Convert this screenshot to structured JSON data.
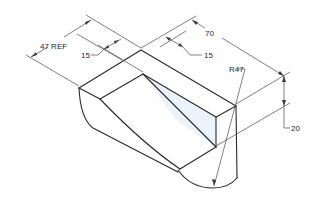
{
  "drawing": {
    "type": "isometric technical drawing",
    "subject": "block with slanted cut and curved (radius) bottom"
  },
  "dimensions": {
    "reference_width": "47 REF",
    "left_offset": "15",
    "right_offset": "15",
    "length": "70",
    "radius": "R47",
    "height": "20"
  },
  "colors": {
    "line": "#2a2a2a",
    "dimension_line": "#4a4a4a",
    "face_tint": "#eaf3fb",
    "background": "#ffffff"
  }
}
